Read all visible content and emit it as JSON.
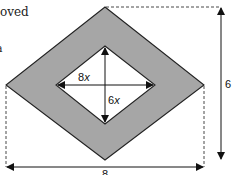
{
  "page": {
    "text_fragment_top": "oved",
    "text_fragment_left": "a"
  },
  "diagram": {
    "fill_color": "#a6a6a6",
    "stroke_color": "#222222",
    "outer_rhombus": {
      "width_label": "8",
      "height_label": "6"
    },
    "inner_rhombus": {
      "width_label_coef": "8",
      "width_label_var": "x",
      "height_label_coef": "6",
      "height_label_var": "x"
    }
  }
}
